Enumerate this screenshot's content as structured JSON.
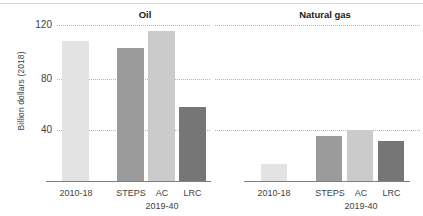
{
  "chart_data": {
    "type": "bar",
    "title": "",
    "ylabel": "Billion dollars (2018)",
    "xlabel": "",
    "ylim": [
      0,
      130
    ],
    "yticks": [
      40,
      80,
      120
    ],
    "ytick_labels": [
      "40",
      "80",
      "120"
    ],
    "grid": true,
    "legend": false,
    "panels": [
      {
        "title": "Oil",
        "categories": [
          "2010-18",
          "STEPS",
          "AC",
          "LRC"
        ],
        "values": [
          110,
          104,
          118,
          58
        ],
        "colors": [
          "#e3e3e3",
          "#9b9b9b",
          "#cbcbcb",
          "#767676"
        ],
        "group_label": "2019-40",
        "group_span": [
          "STEPS",
          "AC",
          "LRC"
        ]
      },
      {
        "title": "Natural gas",
        "categories": [
          "2010-18",
          "STEPS",
          "AC",
          "LRC"
        ],
        "values": [
          13,
          35,
          40,
          31
        ],
        "colors": [
          "#e3e3e3",
          "#9b9b9b",
          "#cbcbcb",
          "#767676"
        ],
        "group_label": "2019-40",
        "group_span": [
          "STEPS",
          "AC",
          "LRC"
        ]
      }
    ],
    "colors": {
      "historical": "#e3e3e3",
      "steps": "#9b9b9b",
      "ac": "#cbcbcb",
      "lrc": "#767676",
      "gridline": "#b4b4b4",
      "axis": "#7f7f7f",
      "text": "#3f3f3f",
      "background": "#ffffff"
    }
  }
}
